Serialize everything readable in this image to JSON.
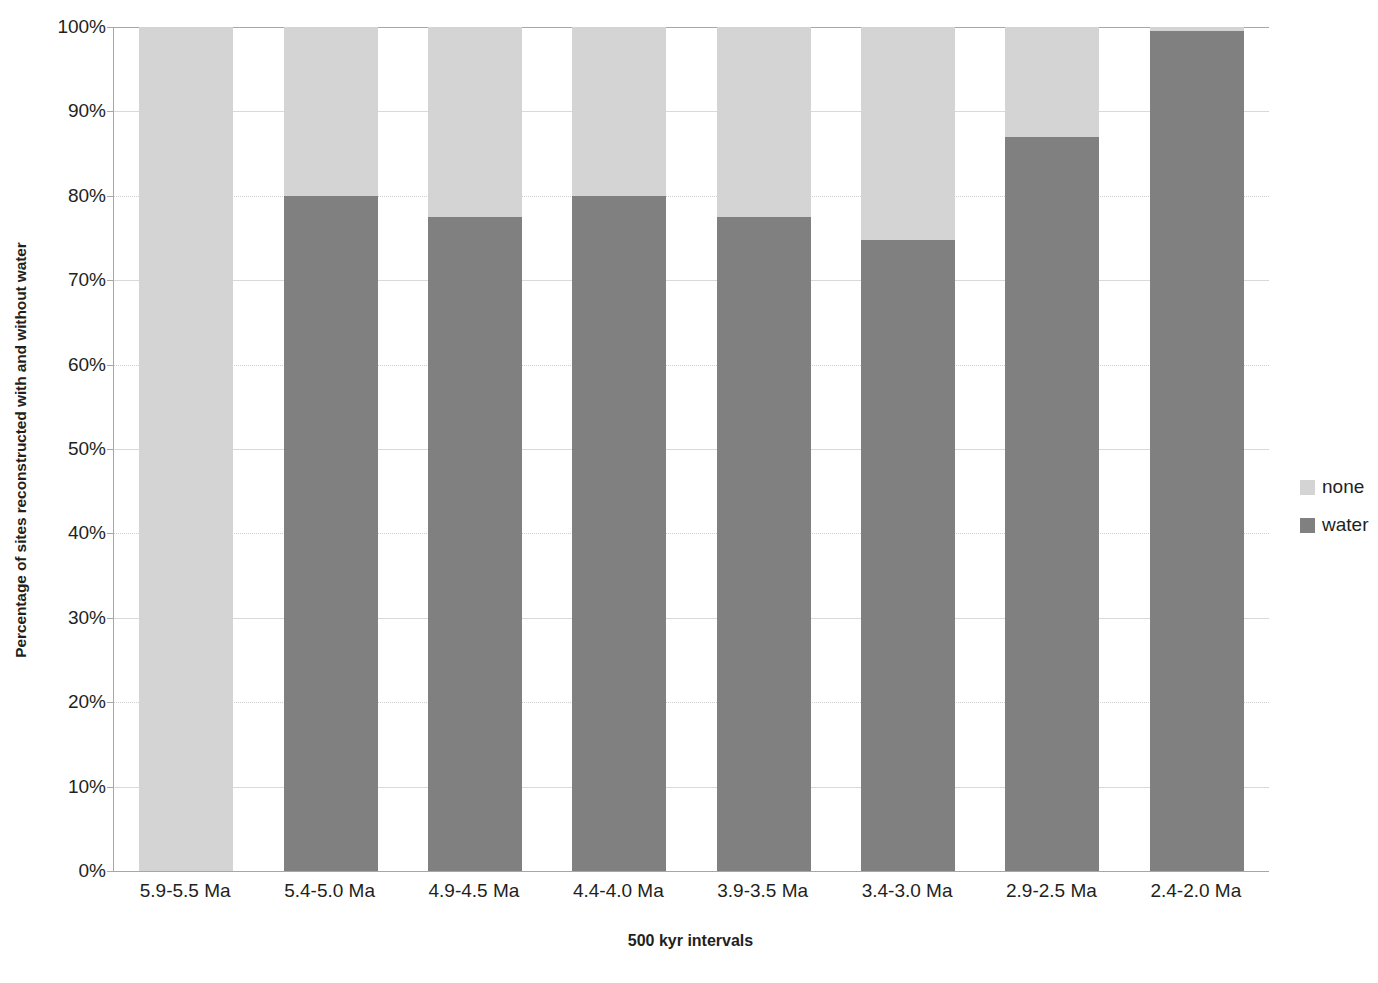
{
  "chart_data": {
    "type": "bar",
    "subtype": "stacked-100-percent",
    "title": "",
    "xlabel": "500 kyr intervals",
    "ylabel": "Percentage of sites reconstructed with and without water",
    "categories": [
      "5.9-5.5 Ma",
      "5.4-5.0 Ma",
      "4.9-4.5 Ma",
      "4.4-4.0 Ma",
      "3.9-3.5 Ma",
      "3.4-3.0 Ma",
      "2.9-2.5 Ma",
      "2.4-2.0 Ma"
    ],
    "series": [
      {
        "name": "water",
        "color": "#808080",
        "values": [
          0,
          80,
          77.5,
          80,
          77.5,
          74.8,
          87,
          99.5
        ]
      },
      {
        "name": "none",
        "color": "#d4d4d4",
        "values": [
          100,
          20,
          22.5,
          20,
          22.5,
          25.2,
          13,
          0.5
        ]
      }
    ],
    "ylim": [
      0,
      100
    ],
    "ytick_values": [
      0,
      10,
      20,
      30,
      40,
      50,
      60,
      70,
      80,
      90,
      100
    ],
    "ytick_labels": [
      "0%",
      "10%",
      "20%",
      "30%",
      "40%",
      "50%",
      "60%",
      "70%",
      "80%",
      "90%",
      "100%"
    ],
    "grid": "horizontal",
    "legend_position": "right",
    "legend_entries": [
      {
        "label": "none",
        "color": "#d4d4d4"
      },
      {
        "label": "water",
        "color": "#808080"
      }
    ]
  },
  "axis": {
    "y_title": "Percentage of sites reconstructed with and without water",
    "x_title": "500 kyr intervals"
  }
}
